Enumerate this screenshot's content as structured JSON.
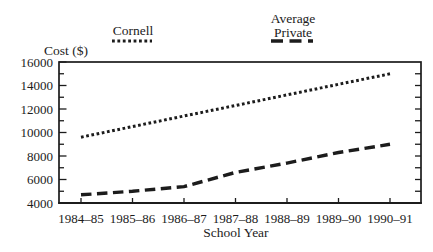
{
  "legend": {
    "cornell": "Cornell",
    "average_line1": "Average",
    "average_line2": "Private"
  },
  "chart_data": {
    "type": "line",
    "title": "",
    "ylabel": "Cost ($)",
    "xlabel": "School Year",
    "categories": [
      "1984–85",
      "1985–86",
      "1986–87",
      "1987–88",
      "1988–89",
      "1989–90",
      "1990–91"
    ],
    "series": [
      {
        "name": "Cornell",
        "style": "dotted",
        "values": [
          9600,
          10500,
          11400,
          12300,
          13200,
          14100,
          15000
        ]
      },
      {
        "name": "Average Private",
        "style": "dashed",
        "values": [
          4700,
          5000,
          5400,
          6600,
          7400,
          8300,
          9000
        ]
      }
    ],
    "ylim": [
      4000,
      16000
    ],
    "yticks": [
      4000,
      6000,
      8000,
      10000,
      12000,
      14000,
      16000
    ],
    "ytick_major_step": 2000,
    "ytick_minor_step": 1000,
    "grid": false,
    "legend_position": "top",
    "ink_color": "#1c1c1c"
  }
}
